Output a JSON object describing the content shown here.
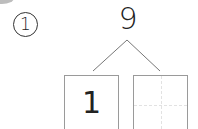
{
  "problem": {
    "index_label": "1",
    "total": "9",
    "parts": [
      {
        "value": "1"
      },
      {
        "value": ""
      }
    ]
  }
}
